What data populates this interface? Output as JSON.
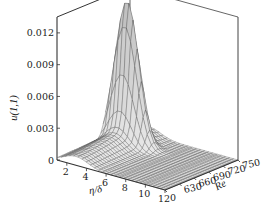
{
  "chart_data": {
    "type": "surface3d",
    "title": "",
    "xlabel": "η/δ",
    "ylabel": "Re",
    "zlabel": "u(1,1)",
    "x_ticks": [
      "2",
      "4",
      "6",
      "8",
      "10",
      "12"
    ],
    "y_ticks": [
      "0",
      "630",
      "660",
      "690",
      "720",
      "750"
    ],
    "z_ticks": [
      "0",
      "0.003",
      "0.006",
      "0.009",
      "0.012"
    ],
    "xlim": [
      1,
      12
    ],
    "ylim": [
      600,
      750
    ],
    "zlim": [
      0,
      0.0135
    ],
    "grid": false,
    "peak": {
      "eta_over_delta": 3,
      "Re": 705,
      "u": 0.0125
    },
    "ridge_profile_at_eta_3": {
      "Re": [
        600,
        630,
        660,
        690,
        705,
        720,
        750
      ],
      "u": [
        0.0008,
        0.0012,
        0.002,
        0.0055,
        0.0125,
        0.004,
        0.0006
      ]
    }
  },
  "axes": {
    "z_label": "u(1,1)",
    "x_label": "η/δ",
    "y_label": "Re"
  }
}
